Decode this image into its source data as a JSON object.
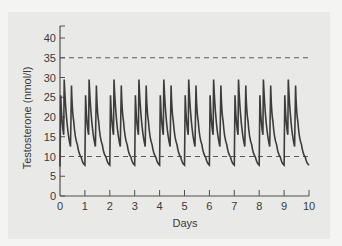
{
  "chart_data": {
    "type": "line",
    "title": "",
    "xlabel": "Days",
    "ylabel": "Testosterone (nmol/l)",
    "xlim": [
      0,
      10
    ],
    "ylim": [
      0,
      42
    ],
    "x_ticks": [
      0,
      1,
      2,
      3,
      4,
      5,
      6,
      7,
      8,
      9,
      10
    ],
    "y_ticks": [
      0,
      5,
      10,
      15,
      20,
      25,
      30,
      35,
      40
    ],
    "grid": false,
    "legend": null,
    "reference_lines": [
      {
        "y": 35,
        "style": "dashed",
        "label": "upper normal limit"
      },
      {
        "y": 10,
        "style": "dashed",
        "label": "lower normal limit"
      }
    ],
    "series": [
      {
        "name": "Testosterone",
        "daily_pattern": [
          {
            "t": 0.0,
            "v": 7.5
          },
          {
            "t": 0.03,
            "v": 25.5
          },
          {
            "t": 0.15,
            "v": 15.5
          },
          {
            "t": 0.17,
            "v": 29.5
          },
          {
            "t": 0.42,
            "v": 12.5
          },
          {
            "t": 0.46,
            "v": 28.0
          },
          {
            "t": 0.55,
            "v": 19.0
          },
          {
            "t": 0.7,
            "v": 13.0
          },
          {
            "t": 0.85,
            "v": 9.8
          },
          {
            "t": 1.0,
            "v": 7.8
          }
        ],
        "days": 10
      }
    ]
  },
  "style": {
    "line_color": "#3c3c3c",
    "axis_color": "#505050",
    "dash_color": "#5a5a5a"
  }
}
